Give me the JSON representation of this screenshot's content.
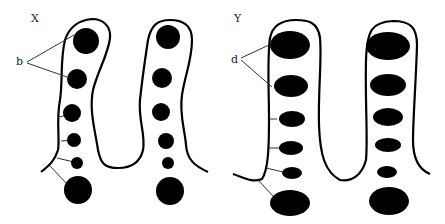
{
  "panels": [
    {
      "id": "X",
      "label": "X",
      "pointer_label": "b"
    },
    {
      "id": "Y",
      "label": "Y",
      "pointer_label": "d"
    }
  ],
  "colors": {
    "ink": "#000000",
    "background": "#ffffff",
    "pointer": "#333333"
  }
}
